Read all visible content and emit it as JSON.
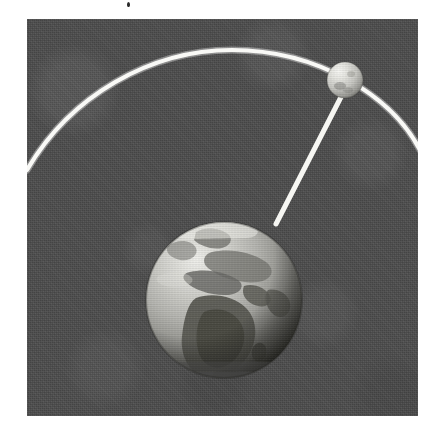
{
  "image": {
    "title": "Satellite orbiting the Earth",
    "medium": "halftone printed grayscale illustration",
    "canvas": {
      "width": 437,
      "height": 442,
      "background_color": "#ffffff"
    },
    "plate": {
      "name": "illustration-plate",
      "x": 27,
      "y": 19,
      "width": 391,
      "height": 397,
      "background_color": "#4b4b4b",
      "texture": "halftone screen noise"
    },
    "margins": {
      "top_band_color": "#ffffff",
      "top_band_width": 273,
      "top_band_height": 19,
      "left_band_width": 27,
      "right_band_start": 418,
      "bottom_band_start": 416
    }
  },
  "objects": {
    "earth": {
      "label": "Earth",
      "center_x": 224,
      "center_y": 300,
      "radius": 78,
      "ocean_color": "#b6b6b2",
      "land_color": "#6f6f6c",
      "highlight_color": "#e6e6e2",
      "shadow_color": "#44443f",
      "lighting": "upper-left",
      "visible_hemisphere": "Europe, Africa and Asia"
    },
    "satellite": {
      "label": "Satellite",
      "center_x": 345,
      "center_y": 80,
      "radius": 18,
      "body_color": "#d9d9d4",
      "highlight_color": "#f2f2ee",
      "shadow_color": "#7e7e79",
      "lighting": "upper-left"
    },
    "orbit_arc": {
      "label": "Orbit path",
      "color": "#f6f6f2",
      "stroke_width": 4,
      "start_x": 27,
      "start_y": 168,
      "apex_x": 232,
      "apex_y": 50,
      "end_x": 418,
      "end_y": 146
    },
    "tether": {
      "label": "Satellite link line",
      "color": "#f6f6f2",
      "stroke_width": 5,
      "from_x": 339,
      "from_y": 98,
      "to_x": 276,
      "to_y": 223
    }
  },
  "scan_artifacts": {
    "speck": {
      "x": 127,
      "y": 2,
      "width": 3,
      "height": 5,
      "color": "#2a2a2a"
    }
  }
}
